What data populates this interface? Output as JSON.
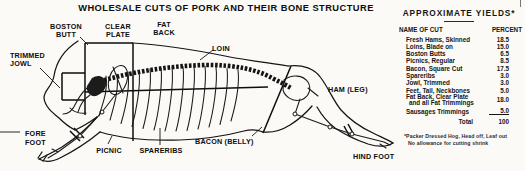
{
  "title": "WHOLESALE CUTS OF PORK AND THEIR BONE STRUCTURE",
  "colors": {
    "ink": "#111111",
    "paper": "#fbfaf6"
  },
  "diagram": {
    "labels": {
      "boston_butt_1": "BOSTON",
      "boston_butt_2": "BUTT",
      "clear_plate_1": "CLEAR",
      "clear_plate_2": "PLATE",
      "fat_back_1": "FAT",
      "fat_back_2": "BACK",
      "loin": "LOIN",
      "trimmed_jowl_1": "TRIMMED",
      "trimmed_jowl_2": "JOWL",
      "ham_leg": "HAM (LEG)",
      "fore_foot_1": "FORE",
      "fore_foot_2": "FOOT",
      "picnic": "PICNIC",
      "spareribs": "SPARERIBS",
      "bacon_belly": "BACON (BELLY)",
      "hind_foot": "HIND FOOT"
    }
  },
  "yields": {
    "title": "APPROXIMATE YIELDS*",
    "header": {
      "name": "NAME OF CUT",
      "percent": "PERCENT"
    },
    "rows": [
      {
        "name": "Fresh Hams, Skinned",
        "percent": "18.5"
      },
      {
        "name": "Loins, Blade on",
        "percent": "15.0"
      },
      {
        "name": "Boston Butts",
        "percent": "6.5"
      },
      {
        "name": "Picnics, Regular",
        "percent": "8.5"
      },
      {
        "name": "Bacon, Square Cut",
        "percent": "17.5"
      },
      {
        "name": "Spareribs",
        "percent": "3.0"
      },
      {
        "name": "Jowl, Trimmed",
        "percent": "3.0"
      },
      {
        "name": "Feet, Tail, Neckbones",
        "percent": "5.0"
      },
      {
        "name": "Fat Back, Clear Plate",
        "name2": "and all Fat Trimmings",
        "percent": "18.0"
      },
      {
        "name": "Sausages Trimmings",
        "percent": "5.0"
      }
    ],
    "total_label": "Total",
    "total_value": "100",
    "footnote_1": "*Packer Dressed Hog, Head off, Leaf out",
    "footnote_2": "No allowance for cutting shrink"
  }
}
